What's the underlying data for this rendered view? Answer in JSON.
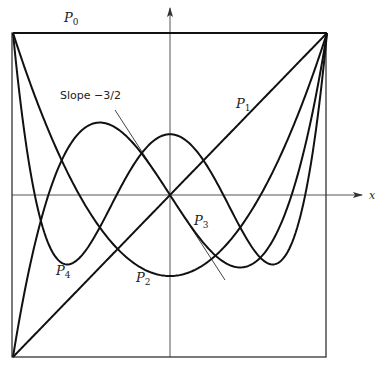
{
  "chart_data": {
    "type": "line",
    "title": "",
    "xlabel": "x",
    "ylabel": "",
    "xlim": [
      -1,
      1
    ],
    "ylim": [
      -1,
      1
    ],
    "grid": false,
    "legend": "inline labels",
    "series": [
      {
        "name": "P0",
        "formula": "1",
        "x": [
          -1,
          0,
          1
        ],
        "values": [
          1,
          1,
          1
        ]
      },
      {
        "name": "P1",
        "formula": "x",
        "x": [
          -1,
          0,
          1
        ],
        "values": [
          -1,
          0,
          1
        ]
      },
      {
        "name": "P2",
        "formula": "(3x^2-1)/2",
        "x": [
          -1,
          -0.5,
          0,
          0.5,
          1
        ],
        "values": [
          1,
          -0.125,
          -0.5,
          -0.125,
          1
        ]
      },
      {
        "name": "P3",
        "formula": "(5x^3-3x)/2",
        "x": [
          -1,
          -0.447,
          0,
          0.447,
          1
        ],
        "values": [
          -1,
          0.447,
          0,
          -0.447,
          1
        ]
      },
      {
        "name": "P4",
        "formula": "(35x^4-30x^2+3)/8",
        "x": [
          -1,
          -0.655,
          0,
          0.655,
          1
        ],
        "values": [
          1,
          -0.429,
          0.375,
          -0.429,
          1
        ]
      }
    ],
    "annotations": [
      {
        "text": "Slope −3/2",
        "type": "tangent",
        "at": [
          0,
          0
        ],
        "slope": -1.5
      }
    ]
  },
  "labels": {
    "p0": {
      "main": "P",
      "sub": "0"
    },
    "p1": {
      "main": "P",
      "sub": "1"
    },
    "p2": {
      "main": "P",
      "sub": "2"
    },
    "p3": {
      "main": "P",
      "sub": "3"
    },
    "p4": {
      "main": "P",
      "sub": "4"
    },
    "x_axis": "x",
    "slope": "Slope −3/2"
  },
  "colors": {
    "curve": "#111111",
    "axis": "#555555",
    "tangent": "#444444"
  }
}
